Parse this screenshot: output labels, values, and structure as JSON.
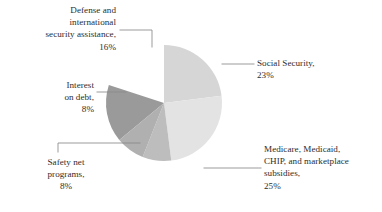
{
  "chart_data": {
    "type": "pie",
    "title": "",
    "subtitle": "",
    "xlabel": "",
    "ylabel": "",
    "grid": false,
    "legend_position": "callout-labels",
    "label_format": "name, percent",
    "start_angle_deg": 0,
    "direction": "clockwise",
    "center": {
      "x": 164,
      "y": 103
    },
    "radius": 58,
    "categories": [
      "Social Security",
      "Medicare, Medicaid, CHIP, and marketplace subsidies",
      "Safety net programs",
      "Interest on debt",
      "Defense and international security assistance"
    ],
    "values": [
      23,
      25,
      8,
      8,
      16
    ],
    "value_suffix": "%",
    "slices": [
      {
        "name": "Social Security",
        "value": 23,
        "percent_text": "23%",
        "color": "#d6d6d6",
        "start_deg": 0,
        "end_deg": 82.8
      },
      {
        "name": "Medicare, Medicaid, CHIP, and marketplace subsidies",
        "value": 25,
        "percent_text": "25%",
        "color": "#e3e3e3",
        "start_deg": 82.8,
        "end_deg": 172.8
      },
      {
        "name": "Safety net programs",
        "value": 8,
        "percent_text": "8%",
        "color": "#bdbdbd",
        "start_deg": 172.8,
        "end_deg": 201.6
      },
      {
        "name": "Interest on debt",
        "value": 8,
        "percent_text": "8%",
        "color": "#b0b0b0",
        "start_deg": 201.6,
        "end_deg": 230.4
      },
      {
        "name": "Defense and international security assistance",
        "value": 16,
        "percent_text": "16%",
        "color": "#9a9a9a",
        "start_deg": 230.4,
        "end_deg": 288.0
      },
      {
        "name": "remainder",
        "value": 20,
        "percent_text": "",
        "color": "#9a9a9a",
        "start_deg": 288.0,
        "end_deg": 360.0
      }
    ],
    "annotations": {
      "defense": "Defense and\ninternational\nsecurity assistance,\n16%",
      "interest": "Interest\non debt,\n8%",
      "safety_net": "Safety net\nprograms,\n8%",
      "social_security": "Social Security,\n23%",
      "medicare": "Medicare, Medicaid,\nCHIP, and marketplace\nsubsidies,\n25%"
    },
    "leader_line_color": "#8a8a8a"
  }
}
